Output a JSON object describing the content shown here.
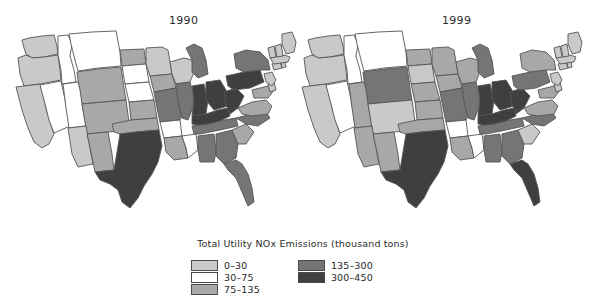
{
  "figure": {
    "panels": [
      {
        "id": "1990",
        "title": "1990"
      },
      {
        "id": "1999",
        "title": "1999"
      }
    ]
  },
  "legend": {
    "caption": "Total Utility NOx Emissions (thousand tons)",
    "columns": [
      {
        "items": [
          {
            "label": "0–30",
            "color": "#c9c9c9"
          },
          {
            "label": "30–75",
            "color": "#ffffff"
          },
          {
            "label": "75–135",
            "color": "#a8a8a8"
          }
        ]
      },
      {
        "items": [
          {
            "label": "135–300",
            "color": "#757575"
          },
          {
            "label": "300–450",
            "color": "#3f3f3f"
          }
        ]
      }
    ]
  },
  "chart_data": {
    "type": "choropleth-map",
    "title": "Total Utility NOx Emissions (thousand tons)",
    "subtitle": "",
    "xlabel": "",
    "ylabel": "",
    "legend_position": "bottom-center",
    "grid": false,
    "class_breaks": [
      0,
      30,
      75,
      135,
      300,
      450
    ],
    "class_labels": [
      "0–30",
      "30–75",
      "75–135",
      "135–300",
      "300–450"
    ],
    "class_colors": [
      "#c9c9c9",
      "#ffffff",
      "#a8a8a8",
      "#757575",
      "#3f3f3f"
    ],
    "series": [
      {
        "name": "1990",
        "values": {
          "WA": 0,
          "OR": 0,
          "CA": 0,
          "NV": 1,
          "ID": 1,
          "MT": 1,
          "WY": 2,
          "UT": 1,
          "AZ": 0,
          "CO": 2,
          "NM": 2,
          "ND": 2,
          "SD": 1,
          "NE": 1,
          "KS": 2,
          "OK": 2,
          "TX": 4,
          "MN": 0,
          "IA": 2,
          "MO": 3,
          "AR": 1,
          "LA": 2,
          "WI": 0,
          "IL": 3,
          "MS": 1,
          "MI": 3,
          "IN": 4,
          "KY": 4,
          "TN": 3,
          "AL": 3,
          "OH": 4,
          "WV": 4,
          "GA": 3,
          "FL": 3,
          "SC": 2,
          "NC": 3,
          "VA": 2,
          "PA": 4,
          "NY": 3,
          "MD": 2,
          "DE": 0,
          "NJ": 0,
          "CT": 0,
          "RI": 0,
          "MA": 0,
          "VT": 0,
          "NH": 0,
          "ME": 0
        }
      },
      {
        "name": "1999",
        "values": {
          "WA": 0,
          "OR": 0,
          "CA": 0,
          "NV": 1,
          "ID": 1,
          "MT": 1,
          "WY": 3,
          "UT": 2,
          "AZ": 2,
          "CO": 0,
          "NM": 2,
          "ND": 2,
          "SD": 0,
          "NE": 2,
          "KS": 2,
          "OK": 2,
          "TX": 4,
          "MN": 2,
          "IA": 2,
          "MO": 3,
          "AR": 1,
          "LA": 2,
          "WI": 2,
          "IL": 3,
          "MS": 1,
          "MI": 3,
          "IN": 4,
          "KY": 4,
          "TN": 3,
          "AL": 3,
          "OH": 4,
          "WV": 4,
          "GA": 3,
          "FL": 4,
          "SC": 0,
          "NC": 3,
          "VA": 2,
          "PA": 3,
          "NY": 2,
          "MD": 2,
          "DE": 0,
          "NJ": 0,
          "CT": 0,
          "RI": 0,
          "MA": 0,
          "VT": 0,
          "NH": 0,
          "ME": 0
        }
      }
    ],
    "geometry": {
      "viewBox": "0 0 300 205",
      "states": {
        "WA": "M20,10 L27,8 L40,6 L52,5 L55,16 L56,24 L42,27 L30,28 L24,24 L22,18 Z",
        "OR": "M16,28 L24,25 L31,28 L42,27 L56,25 L58,40 L59,50 L38,54 L22,56 L18,44 Z",
        "CA": "M14,57 L22,56 L38,54 L41,64 L44,78 L48,92 L52,104 L47,114 L40,118 L32,112 L26,98 L20,80 Z",
        "NV": "M38,55 L59,51 L64,74 L68,96 L52,103 L47,90 L43,74 Z",
        "ID": "M56,6 L66,5 L70,14 L68,26 L72,40 L74,52 L60,54 L59,40 L56,25 Z",
        "MT": "M67,4 L90,2 L114,1 L118,22 L119,36 L96,38 L76,41 L73,30 L69,14 Z",
        "WY": "M75,42 L96,39 L119,37 L122,58 L124,70 L102,72 L80,74 L77,58 Z",
        "UT": "M61,54 L76,52 L78,60 L80,74 L84,96 L67,98 L64,78 Z",
        "CO": "M80,74 L102,72 L124,70 L127,92 L128,100 L106,102 L85,104 Z",
        "AZ": "M66,98 L84,96 L88,118 L91,134 L76,137 L70,124 Z",
        "NM": "M85,104 L106,102 L110,124 L112,140 L93,142 L89,122 Z",
        "ND": "M118,20 L142,19 L144,34 L120,36 Z",
        "SD": "M120,36 L144,34 L147,52 L123,54 Z",
        "NE": "M123,54 L147,52 L152,70 L127,72 Z",
        "KS": "M127,72 L152,70 L155,88 L129,90 Z",
        "OK": "M110,94 L129,90 L155,88 L157,100 L134,102 L118,104 L112,102 Z",
        "TX": "M93,142 L112,140 L118,104 L134,102 L157,100 L160,116 L156,132 L150,144 L142,156 L136,168 L128,178 L120,172 L116,160 L108,154 L98,150 Z",
        "MN": "M144,18 L160,17 L166,20 L168,32 L170,44 L148,46 L144,34 Z",
        "IA": "M148,46 L170,44 L174,58 L152,62 Z",
        "MO": "M152,62 L174,58 L180,66 L182,80 L178,90 L158,92 L155,78 Z",
        "AR": "M158,92 L178,90 L180,106 L162,108 Z",
        "LA": "M162,108 L180,106 L184,118 L186,128 L172,130 L164,122 Z",
        "WI": "M168,32 L182,28 L190,30 L192,42 L188,52 L174,54 L170,44 Z",
        "IL": "M174,54 L188,52 L192,66 L190,80 L186,90 L180,88 L176,72 Z",
        "MS": "M180,106 L194,104 L196,120 L186,128 L184,118 Z",
        "MI": "M184,18 L192,14 L200,18 L204,30 L206,44 L196,48 L190,42 L190,30 Z",
        "IN": "M190,56 L202,54 L206,70 L204,84 L190,86 L192,70 Z",
        "KY": "M190,86 L204,84 L216,80 L226,78 L228,86 L216,92 L200,96 L190,94 Z",
        "TN": "M190,96 L206,94 L222,90 L234,88 L236,96 L218,100 L198,104 L192,104 Z",
        "AL": "M196,106 L212,104 L214,122 L212,132 L198,132 L196,120 Z",
        "OH": "M204,52 L218,50 L224,60 L226,76 L212,80 L204,70 Z",
        "WV": "M222,62 L234,58 L242,66 L236,78 L228,84 L224,74 Z",
        "GA": "M214,104 L230,100 L236,114 L234,128 L222,134 L214,126 Z",
        "FL": "M222,134 L234,130 L240,134 L246,144 L250,158 L252,172 L246,176 L240,162 L234,148 L226,140 Z",
        "SC": "M230,100 L244,94 L252,102 L244,114 L236,114 Z",
        "NC": "M234,88 L250,84 L264,82 L268,88 L256,96 L244,94 Z",
        "VA": "M236,78 L250,72 L264,70 L270,76 L266,84 L250,86 L240,84 Z",
        "PA": "M224,46 L242,42 L258,40 L262,52 L248,58 L232,60 L226,56 Z",
        "NY": "M232,24 L244,20 L258,22 L266,30 L268,40 L258,40 L242,42 L234,38 Z",
        "MD": "M250,60 L266,56 L272,60 L266,68 L252,68 Z",
        "DE": "M266,54 L272,52 L274,60 L268,62 Z",
        "NJ": "M262,44 L270,42 L274,50 L270,56 L264,52 Z",
        "CT": "M270,34 L278,32 L280,38 L272,40 Z",
        "RI": "M279,32 L283,31 L284,37 L280,38 Z",
        "MA": "M268,28 L282,25 L288,27 L286,32 L272,34 Z",
        "VT": "M266,18 L272,16 L274,27 L268,28 Z",
        "NH": "M273,16 L279,14 L281,26 L275,27 Z",
        "ME": "M280,4 L290,2 L294,12 L292,22 L284,24 L280,14 Z"
      }
    }
  }
}
